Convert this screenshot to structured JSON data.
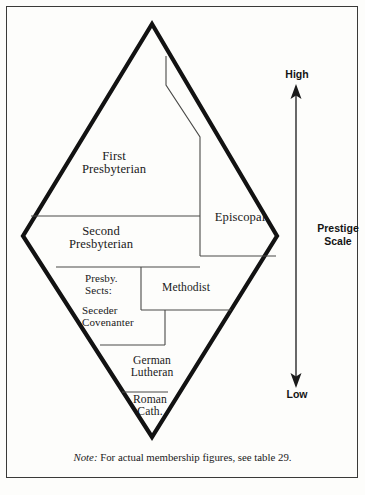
{
  "figure": {
    "type": "diamond-stratification-diagram",
    "note_prefix": "Note:",
    "note_text": " For actual membership figures, see table 29."
  },
  "diamond_segments": [
    {
      "id": "first-presbyterian",
      "label_line1": "First",
      "label_line2": "Presbyterian"
    },
    {
      "id": "episcopal",
      "label_line1": "Episcopal",
      "label_line2": ""
    },
    {
      "id": "second-presbyterian",
      "label_line1": "Second",
      "label_line2": "Presbyterian"
    },
    {
      "id": "presbyterian-sects",
      "label_line1": "Presby.",
      "label_line2": "Sects:"
    },
    {
      "id": "methodist",
      "label_line1": "Methodist",
      "label_line2": ""
    },
    {
      "id": "seceder-covenanter",
      "label_line1": "Seceder",
      "label_line2": "Covenanter"
    },
    {
      "id": "german-lutheran",
      "label_line1": "German",
      "label_line2": "Lutheran"
    },
    {
      "id": "roman-catholic",
      "label_line1": "Roman",
      "label_line2": "Cath."
    }
  ],
  "scale": {
    "high_label": "High",
    "low_label": "Low",
    "title_line1": "Prestige",
    "title_line2": "Scale"
  },
  "colors": {
    "ink": "#1a1a1a",
    "frame": "#3a3a38",
    "paper": "#fdfdfb",
    "thin_line": "#4a4a48"
  }
}
